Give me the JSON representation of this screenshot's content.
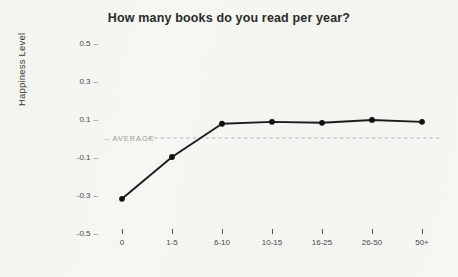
{
  "chart_data": {
    "type": "line",
    "title": "How many books do you read per year?",
    "xlabel": "",
    "ylabel": "Happiness Level",
    "categories": [
      "0",
      "1-5",
      "6-10",
      "10-15",
      "16-25",
      "26-50",
      "50+"
    ],
    "values": [
      -0.32,
      -0.1,
      0.075,
      0.085,
      0.08,
      0.095,
      0.085
    ],
    "series": [
      {
        "name": "Happiness Level",
        "values": [
          -0.32,
          -0.1,
          0.075,
          0.085,
          0.08,
          0.095,
          0.085
        ]
      }
    ],
    "ylim": [
      -0.6,
      0.6
    ],
    "yticks": [
      0.5,
      0.3,
      0.1,
      -0.1,
      -0.3,
      -0.5
    ],
    "ytick_labels": [
      "0.5",
      "0.3",
      "0.1",
      "-0.1",
      "-0.3",
      "-0.5"
    ],
    "grid": false,
    "legend": "none",
    "annotations": [
      {
        "name": "average-line",
        "label": "AVERAGE",
        "label_prefix": "--",
        "y": 0.0,
        "style": "dashed-horizontal"
      }
    ],
    "colors": {
      "background": "#f6f6f3",
      "line": "#1c1c1c",
      "marker": "#111111",
      "text": "#3a3a3a",
      "title": "#2b2b2b",
      "average_line": "#b4b4b4",
      "average_label": "#9a9a9a"
    }
  }
}
